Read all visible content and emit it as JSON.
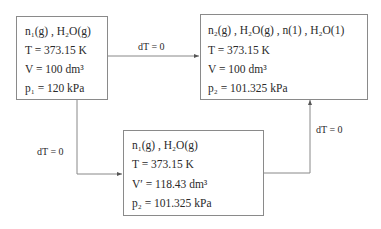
{
  "diagram": {
    "type": "process-path",
    "states": [
      {
        "id": "initial",
        "species": "n1(g), H2O(g)",
        "lines": [
          "n₁(g) , H₂O(g)",
          "T = 373.15 K",
          "V = 100 dm³",
          "p₁ = 120 kPa"
        ]
      },
      {
        "id": "final",
        "species": "n2(g), H2O(g), n(l), H2O(l)",
        "lines": [
          "n₂(g) , H₂O(g) , n(1) , H₂O(1)",
          "T = 373.15 K",
          "V = 100 dm³",
          "p₂ = 101.325 kPa"
        ]
      },
      {
        "id": "intermediate",
        "species": "n1(g), H2O(g)",
        "lines": [
          "n₁(g) , H₂O(g)",
          "T  =  373.15 K",
          "V′  =  118.43 dm³",
          "p₂  =  101.325 kPa"
        ]
      }
    ],
    "edges": [
      {
        "from": "initial",
        "to": "final",
        "label": "dT = 0"
      },
      {
        "from": "initial",
        "to": "intermediate",
        "label": "dT = 0"
      },
      {
        "from": "intermediate",
        "to": "final",
        "label": "dT = 0"
      }
    ]
  }
}
